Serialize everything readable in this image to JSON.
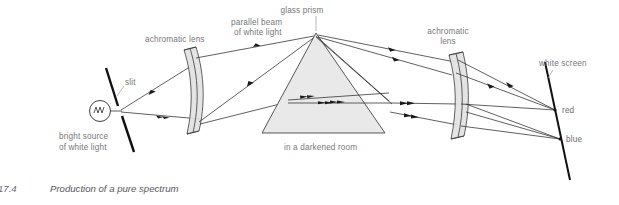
{
  "figure": {
    "caption_number": "17.4",
    "caption_text": "Production of a pure spectrum",
    "background_color": "#ffffff"
  },
  "labels": {
    "source": "bright source\nof white light",
    "source_line1": "bright source",
    "source_line2": "of white light",
    "slit": "slit",
    "lens_left_line1": "achromatic lens",
    "beam_line1": "parallel beam",
    "beam_line2": "of white light",
    "prism": "glass prism",
    "room": "in a darkened room",
    "lens_right_line1": "achromatic",
    "lens_right_line2": "lens",
    "screen": "white screen",
    "red": "red",
    "blue": "blue"
  },
  "colors": {
    "ink": "#2b2b2b",
    "label_gray": "#77777a",
    "prism_fill": "#e9e9e9",
    "lens_fill": "#e2e2e2",
    "barrier": "#111111"
  },
  "optics": {
    "source_bulb": {
      "cx": 100,
      "cy": 111,
      "r": 10.5
    },
    "slit_point": {
      "x": 120,
      "y": 111
    },
    "prism_apex": {
      "x": 316,
      "y": 33
    },
    "prism_left_base": {
      "x": 262,
      "y": 133
    },
    "prism_right_base": {
      "x": 385,
      "y": 133
    },
    "screen_top": {
      "x": 548,
      "y": 62
    },
    "screen_bottom": {
      "x": 568,
      "y": 172
    },
    "red_focus": {
      "x": 555,
      "y": 110
    },
    "blue_focus": {
      "x": 560,
      "y": 139
    }
  }
}
